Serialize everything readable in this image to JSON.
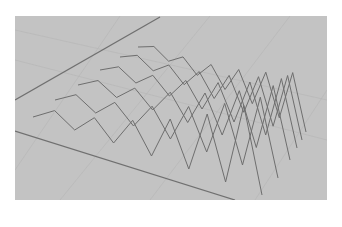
{
  "canvas": {
    "width": 342,
    "height": 227,
    "background": "#ffffff"
  },
  "viewport": {
    "x": 15,
    "y": 16,
    "width": 312,
    "height": 184,
    "fill": "#c3c3c3",
    "grid_color": "#b6b6b6",
    "line_color": "#6e6e6e",
    "floor_line_color": "#707070"
  },
  "floor_lines": [
    {
      "x1": 15,
      "y1": 100,
      "x2": 160,
      "y2": 17
    },
    {
      "x1": 15,
      "y1": 131,
      "x2": 235,
      "y2": 200
    }
  ],
  "grid_lines": [
    {
      "x1": 15,
      "y1": 60,
      "x2": 327,
      "y2": 140
    },
    {
      "x1": 15,
      "y1": 30,
      "x2": 327,
      "y2": 100
    },
    {
      "x1": 60,
      "y1": 200,
      "x2": 210,
      "y2": 16
    },
    {
      "x1": 150,
      "y1": 200,
      "x2": 290,
      "y2": 16
    },
    {
      "x1": 255,
      "y1": 200,
      "x2": 327,
      "y2": 90
    },
    {
      "x1": 15,
      "y1": 170,
      "x2": 120,
      "y2": 16
    }
  ],
  "zigzag_rows": [
    {
      "start": [
        33,
        117
      ],
      "end": [
        262,
        195
      ],
      "peaks": 6,
      "amp_start": 12,
      "amp_end": 95
    },
    {
      "start": [
        55,
        100
      ],
      "end": [
        278,
        178
      ],
      "peaks": 6,
      "amp_start": 11,
      "amp_end": 85
    },
    {
      "start": [
        78,
        85
      ],
      "end": [
        290,
        160
      ],
      "peaks": 6,
      "amp_start": 10,
      "amp_end": 78
    },
    {
      "start": [
        100,
        70
      ],
      "end": [
        297,
        148
      ],
      "peaks": 6,
      "amp_start": 9,
      "amp_end": 72
    },
    {
      "start": [
        120,
        57
      ],
      "end": [
        302,
        140
      ],
      "peaks": 6,
      "amp_start": 8,
      "amp_end": 66
    },
    {
      "start": [
        138,
        47
      ],
      "end": [
        306,
        132
      ],
      "peaks": 6,
      "amp_start": 7,
      "amp_end": 60
    }
  ]
}
